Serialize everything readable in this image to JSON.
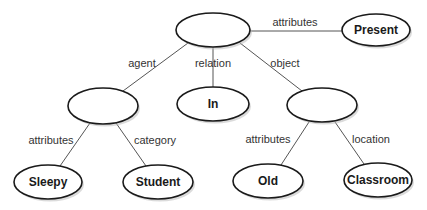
{
  "diagram": {
    "type": "semantic-network",
    "nodes": [
      {
        "id": "root",
        "label": "",
        "cx": 213,
        "cy": 30,
        "rx": 37,
        "ry": 17
      },
      {
        "id": "present",
        "label": "Present",
        "cx": 376,
        "cy": 30,
        "rx": 34,
        "ry": 16
      },
      {
        "id": "agentNode",
        "label": "",
        "cx": 103,
        "cy": 106,
        "rx": 35,
        "ry": 18
      },
      {
        "id": "in",
        "label": "In",
        "cx": 213,
        "cy": 104,
        "rx": 36,
        "ry": 17
      },
      {
        "id": "objectNode",
        "label": "",
        "cx": 322,
        "cy": 105,
        "rx": 35,
        "ry": 17
      },
      {
        "id": "sleepy",
        "label": "Sleepy",
        "cx": 48,
        "cy": 182,
        "rx": 34,
        "ry": 17
      },
      {
        "id": "student",
        "label": "Student",
        "cx": 158,
        "cy": 182,
        "rx": 35,
        "ry": 17
      },
      {
        "id": "old",
        "label": "Old",
        "cx": 268,
        "cy": 181,
        "rx": 35,
        "ry": 17
      },
      {
        "id": "classroom",
        "label": "Classroom",
        "cx": 378,
        "cy": 180,
        "rx": 34,
        "ry": 17
      }
    ],
    "edges": [
      {
        "from": "root",
        "to": "present",
        "label": "attributes",
        "x1": 250,
        "y1": 31,
        "x2": 342,
        "y2": 31,
        "lx": 295,
        "ly": 26
      },
      {
        "from": "root",
        "to": "agentNode",
        "label": "agent",
        "x1": 188,
        "y1": 43,
        "x2": 123,
        "y2": 91,
        "lx": 142,
        "ly": 67
      },
      {
        "from": "root",
        "to": "in",
        "label": "relation",
        "x1": 213,
        "y1": 47,
        "x2": 213,
        "y2": 87,
        "lx": 213,
        "ly": 67
      },
      {
        "from": "root",
        "to": "objectNode",
        "label": "object",
        "x1": 240,
        "y1": 43,
        "x2": 302,
        "y2": 91,
        "lx": 285,
        "ly": 67
      },
      {
        "from": "agentNode",
        "to": "sleepy",
        "label": "attributes",
        "x1": 90,
        "y1": 123,
        "x2": 60,
        "y2": 166,
        "lx": 51,
        "ly": 144
      },
      {
        "from": "agentNode",
        "to": "student",
        "label": "category",
        "x1": 116,
        "y1": 123,
        "x2": 146,
        "y2": 166,
        "lx": 155,
        "ly": 144
      },
      {
        "from": "objectNode",
        "to": "old",
        "label": "attributes",
        "x1": 309,
        "y1": 122,
        "x2": 281,
        "y2": 165,
        "lx": 268,
        "ly": 143
      },
      {
        "from": "objectNode",
        "to": "classroom",
        "label": "location",
        "x1": 335,
        "y1": 122,
        "x2": 364,
        "y2": 164,
        "lx": 371,
        "ly": 143
      }
    ]
  }
}
